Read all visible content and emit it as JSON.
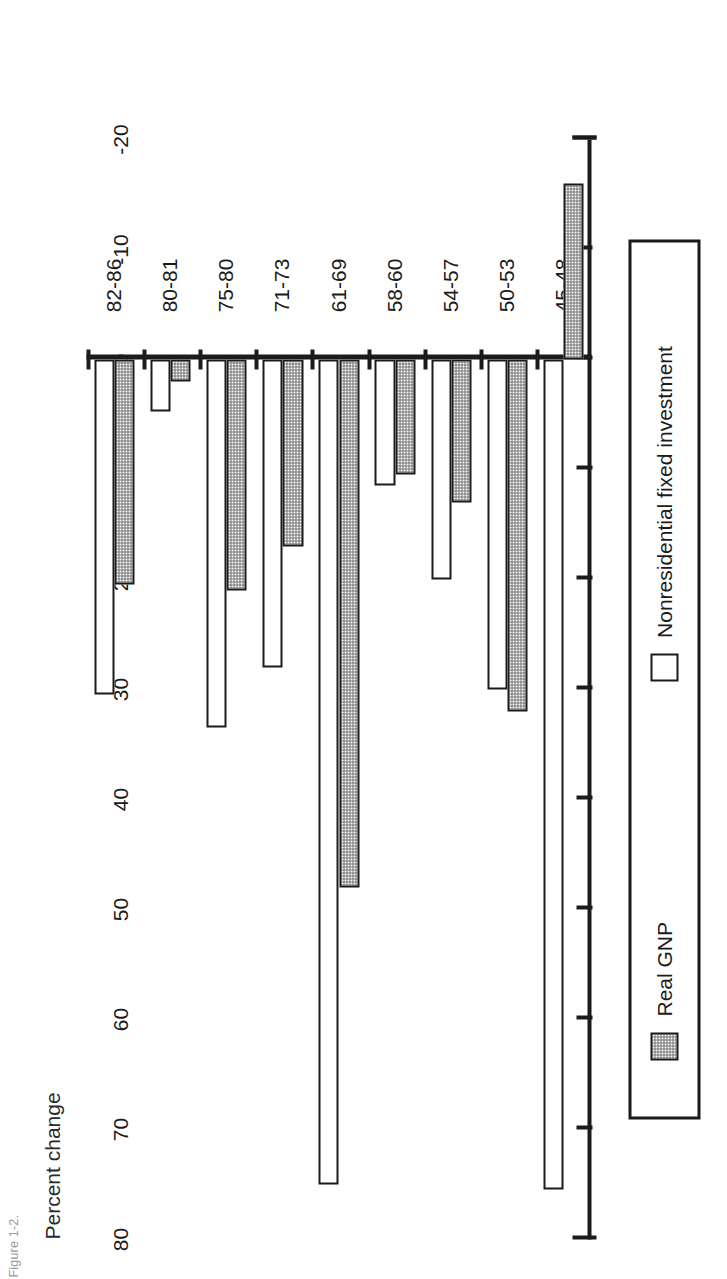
{
  "figure": {
    "caption": "Figure 1-2.",
    "axis_title": "Percent change"
  },
  "legend": {
    "position": "below-plot",
    "entries": [
      {
        "label": "Real GNP",
        "swatch": "hatched-gray",
        "icon": "legend-swatch-icon"
      },
      {
        "label": "Nonresidential fixed investment",
        "swatch": "open-white",
        "icon": "legend-swatch-icon"
      }
    ]
  },
  "chart_data": {
    "type": "bar",
    "orientation": "vertical-rendered-rotated",
    "title": "Percent change",
    "xlabel": "",
    "ylabel": "Percent change",
    "ylim": [
      -20,
      80
    ],
    "grid": false,
    "tick_labels": [
      "80",
      "70",
      "60",
      "50",
      "40",
      "30",
      "20",
      "10",
      "0",
      "-10",
      "-20"
    ],
    "ticks": [
      80,
      70,
      60,
      50,
      40,
      30,
      20,
      10,
      0,
      -10,
      -20
    ],
    "categories": [
      "45-48",
      "50-53",
      "54-57",
      "58-60",
      "61-69",
      "71-73",
      "75-80",
      "80-81",
      "82-86"
    ],
    "series": [
      {
        "name": "Real GNP",
        "style": "hatched-gray",
        "values": [
          -16,
          32,
          13,
          10.5,
          48,
          17,
          21,
          2,
          20.5
        ]
      },
      {
        "name": "Nonresidential fixed investment",
        "style": "open-white",
        "values": [
          75.5,
          30,
          20,
          11.5,
          75,
          28,
          33.5,
          4.7,
          30.5
        ]
      }
    ]
  },
  "colors": {
    "ink": "#1b1b1b",
    "hatch": "#6f6f6f",
    "background": "#ffffff"
  }
}
